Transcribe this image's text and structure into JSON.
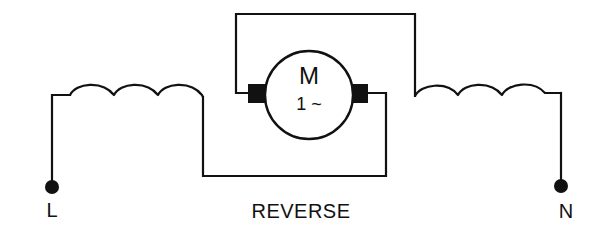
{
  "diagram": {
    "type": "wiring-schematic",
    "caption": "REVERSE",
    "motor": {
      "symbol": "M",
      "phase": "1 ~",
      "description": "single-phase AC motor with two brushes"
    },
    "terminals": {
      "left": {
        "label": "L"
      },
      "right": {
        "label": "N"
      }
    },
    "components": [
      {
        "id": "coil-left",
        "type": "inductor",
        "turns": 3
      },
      {
        "id": "coil-right",
        "type": "inductor",
        "turns": 3
      },
      {
        "id": "motor",
        "type": "motor"
      },
      {
        "id": "brush-left",
        "type": "brush"
      },
      {
        "id": "brush-right",
        "type": "brush"
      }
    ],
    "connections": [
      "L terminal -> left coil",
      "left coil -> bottom wire -> right brush",
      "left brush -> top loop wire -> right coil",
      "right coil -> N terminal"
    ],
    "colors": {
      "ink": "#111111",
      "background": "#ffffff"
    }
  }
}
